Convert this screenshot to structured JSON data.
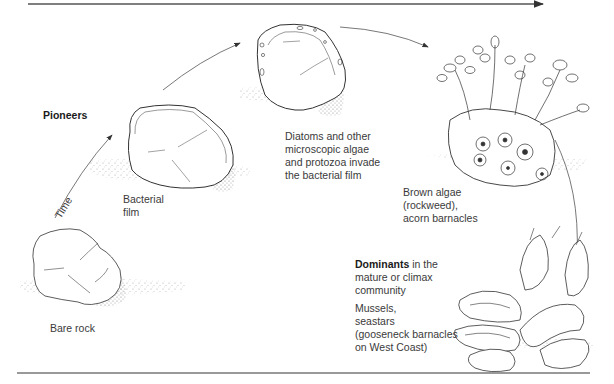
{
  "figure": {
    "time_axis_label": "Time",
    "stages": [
      {
        "id": "bare-rock",
        "lines": [
          "Bare rock"
        ]
      },
      {
        "id": "bacterial-film",
        "lines": [
          "Bacterial",
          "film"
        ]
      },
      {
        "id": "diatoms",
        "lines": [
          "Diatoms and other",
          "microscopic algae",
          "and protozoa invade",
          "the bacterial film"
        ]
      },
      {
        "id": "brown-algae",
        "lines": [
          "Brown algae",
          "(rockweed),",
          "acorn barnacles"
        ]
      },
      {
        "id": "climax",
        "lines": [
          "Mussels,",
          "seastars",
          "(gooseneck barnacles",
          "on West Coast)"
        ]
      }
    ],
    "pioneers_label": "Pioneers",
    "dominants": {
      "bold": "Dominants",
      "rest_line1": " in the",
      "line2": "mature or climax",
      "line3": "community"
    }
  }
}
